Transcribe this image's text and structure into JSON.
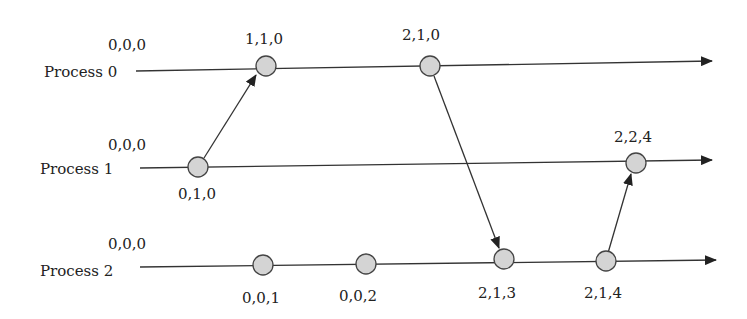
{
  "colors": {
    "line": "#333333",
    "node_fill": "#d4d4d4",
    "node_stroke": "#444444",
    "text": "#222222"
  },
  "processes": [
    {
      "label": "Process 0",
      "initial": "0,0,0"
    },
    {
      "label": "Process 1",
      "initial": "0,0,0"
    },
    {
      "label": "Process 2",
      "initial": "0,0,0"
    }
  ],
  "events": [
    {
      "process": 0,
      "clock": "1,1,0"
    },
    {
      "process": 0,
      "clock": "2,1,0"
    },
    {
      "process": 1,
      "clock": "0,1,0"
    },
    {
      "process": 1,
      "clock": "2,2,4"
    },
    {
      "process": 2,
      "clock": "0,0,1"
    },
    {
      "process": 2,
      "clock": "0,0,2"
    },
    {
      "process": 2,
      "clock": "2,1,3"
    },
    {
      "process": 2,
      "clock": "2,1,4"
    }
  ],
  "messages": [
    {
      "from": "0,1,0",
      "to": "1,1,0"
    },
    {
      "from": "2,1,0",
      "to": "2,1,3"
    },
    {
      "from": "2,1,4",
      "to": "2,2,4"
    }
  ]
}
